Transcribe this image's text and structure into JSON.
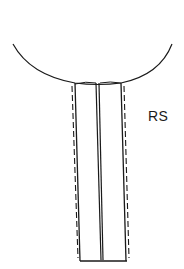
{
  "diagram": {
    "title": "",
    "labels": {
      "rs": "RS"
    },
    "colors": {
      "stroke": "#1a1a1a",
      "background": "#ffffff"
    },
    "elements": [
      {
        "type": "arc",
        "name": "rounded-top-surface"
      },
      {
        "type": "solid-line",
        "name": "left-solid-wall"
      },
      {
        "type": "dashed-line",
        "name": "left-dashed-outline"
      },
      {
        "type": "double-line",
        "name": "center-divider"
      },
      {
        "type": "solid-line",
        "name": "right-solid-wall"
      },
      {
        "type": "dashed-line",
        "name": "right-dashed-outline"
      },
      {
        "type": "solid-line",
        "name": "bottom-edge"
      }
    ]
  }
}
